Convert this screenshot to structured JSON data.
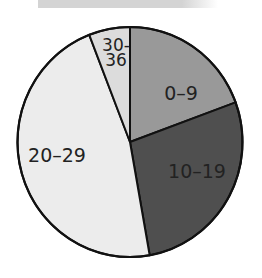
{
  "chart_data": {
    "type": "pie",
    "title": "",
    "categories": [
      "0–9",
      "10–19",
      "20–29",
      "30-36"
    ],
    "values": [
      19.4,
      27.8,
      46.9,
      5.9
    ],
    "units": "percent (estimated from slice angles)",
    "start_angle_deg": 0,
    "direction": "clockwise",
    "colors": [
      "#999999",
      "#4f4f4f",
      "#ececec",
      "#dcdcdc"
    ],
    "labels_inside": true,
    "legend": "none"
  },
  "labels": {
    "s0": "0–9",
    "s1": "10–19",
    "s2": "20–29",
    "s3_line1": "30-",
    "s3_line2": "36"
  }
}
